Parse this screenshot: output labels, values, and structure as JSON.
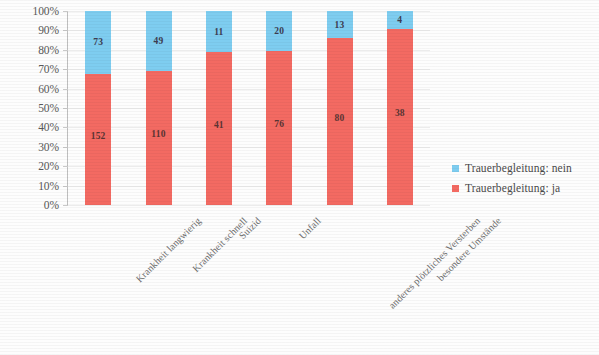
{
  "chart_data": {
    "type": "bar",
    "stacked": true,
    "normalized": "100%",
    "title": "",
    "subtitle": "",
    "xlabel": "",
    "ylabel": "",
    "ylim": [
      0,
      100
    ],
    "grid": true,
    "legend_position": "right",
    "categories": [
      "Krankheit langwierig",
      "Krankheit schnell",
      "Suizid",
      "Unfall",
      "anderes plötzliches Versterben",
      "besondere Umstände"
    ],
    "ytick_labels": [
      "100%",
      "90%",
      "80%",
      "70%",
      "60%",
      "50%",
      "40%",
      "30%",
      "20%",
      "10%",
      "0%"
    ],
    "ytick_values": [
      100,
      90,
      80,
      70,
      60,
      50,
      40,
      30,
      20,
      10,
      0
    ],
    "series": [
      {
        "name": "Trauerbegleitung: nein",
        "color": "#7ecdf0",
        "values": [
          73,
          49,
          11,
          20,
          13,
          4
        ],
        "percents": [
          32.4,
          30.8,
          21.2,
          20.8,
          14.0,
          9.5
        ]
      },
      {
        "name": "Trauerbegleitung: ja",
        "color": "#f36a62",
        "values": [
          152,
          110,
          41,
          76,
          80,
          38
        ],
        "percents": [
          67.6,
          69.2,
          78.8,
          79.2,
          86.0,
          90.5
        ]
      }
    ]
  },
  "legend": {
    "items": [
      {
        "label": "Trauerbegleitung: nein",
        "color": "#7ecdf0"
      },
      {
        "label": "Trauerbegleitung: ja",
        "color": "#f36a62"
      }
    ]
  }
}
